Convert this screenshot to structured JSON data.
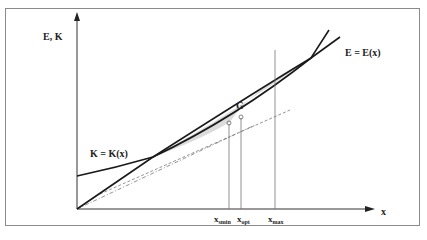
{
  "diagram": {
    "y_axis_label": "E, K",
    "x_axis_label": "x",
    "curves": [
      {
        "name": "K",
        "label": "K = K(x)"
      },
      {
        "name": "E",
        "label": "E = E(x)"
      }
    ],
    "region_label": "G",
    "markers": [
      {
        "label_main": "x",
        "label_sub": "smin"
      },
      {
        "label_main": "x",
        "label_sub": "opt"
      },
      {
        "label_main": "x",
        "label_sub": "max"
      }
    ],
    "colors": {
      "curve": "#1a1a1a",
      "axis": "#333333",
      "shaded_region": "#dcdcdc",
      "frame": "#8a8a8a",
      "guide_lines": "#666666"
    }
  }
}
